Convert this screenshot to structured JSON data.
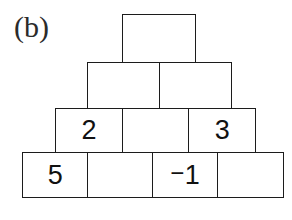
{
  "figure": {
    "panel_label": "(b)"
  },
  "chart_data": {
    "type": "table",
    "title": "(b)",
    "xlabel": "",
    "ylabel": "",
    "rows": [
      {
        "index": 1,
        "cells": [
          ""
        ]
      },
      {
        "index": 2,
        "cells": [
          "",
          ""
        ]
      },
      {
        "index": 3,
        "cells": [
          "2",
          "",
          "3"
        ]
      },
      {
        "index": 4,
        "cells": [
          "5",
          "",
          "-1",
          ""
        ]
      }
    ]
  },
  "pyramid": {
    "row1": {
      "cell1": ""
    },
    "row2": {
      "cell1": "",
      "cell2": ""
    },
    "row3": {
      "cell1": "2",
      "cell2": "",
      "cell3": "3"
    },
    "row4": {
      "cell1": "5",
      "cell2": "",
      "cell3_minus": "−",
      "cell3_digit": "1",
      "cell4": ""
    }
  },
  "colors": {
    "background": "#ffffff",
    "stroke": "#1c1c1c",
    "text": "#111111",
    "label": "#2b2b2b"
  }
}
